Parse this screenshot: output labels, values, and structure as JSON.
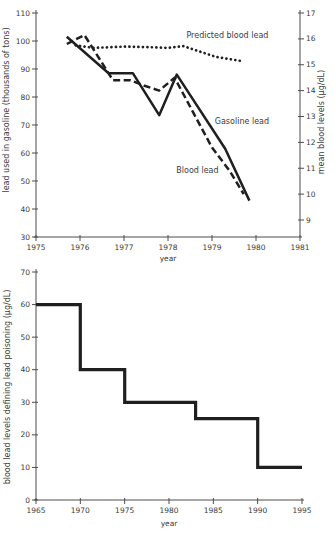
{
  "page": {
    "background": "#ffffff",
    "ink": "#1f1f1f",
    "axis_color": "#4d4d4d",
    "text_color": "#3b3b3b"
  },
  "chart_data": [
    {
      "id": "gasoline-blood-lead",
      "type": "line",
      "title": "",
      "xlabel": "year",
      "xlim": [
        1975,
        1981
      ],
      "xticks": [
        1975,
        1976,
        1977,
        1978,
        1979,
        1980,
        1981
      ],
      "left_axis": {
        "label": "lead used in gasoline (thousands of tons)",
        "lim": [
          30,
          110
        ],
        "ticks": [
          30,
          40,
          50,
          60,
          70,
          80,
          90,
          100,
          110
        ]
      },
      "right_axis": {
        "label": "mean blood levels (µg/dL)",
        "lim": [
          9,
          17
        ],
        "ticks": [
          9,
          10,
          11,
          12,
          13,
          14,
          15,
          16,
          17
        ]
      },
      "grid": false,
      "legend": "inline-annotations",
      "series": [
        {
          "name": "Gasoline lead",
          "axis": "left",
          "style": "solid",
          "points": [
            [
              1975.7,
              101.5
            ],
            [
              1976.65,
              88.5
            ],
            [
              1977.2,
              88.5
            ],
            [
              1977.8,
              73.5
            ],
            [
              1978.2,
              88
            ],
            [
              1979.3,
              61.5
            ],
            [
              1979.85,
              43
            ]
          ]
        },
        {
          "name": "Blood lead",
          "axis": "right",
          "style": "dashed",
          "points": [
            [
              1975.7,
              15.8
            ],
            [
              1976.1,
              16.15
            ],
            [
              1976.75,
              14.4
            ],
            [
              1977.15,
              14.4
            ],
            [
              1977.45,
              14.2
            ],
            [
              1977.8,
              14.0
            ],
            [
              1978.15,
              14.5
            ],
            [
              1979.0,
              11.8
            ],
            [
              1979.4,
              10.9
            ],
            [
              1979.72,
              10.0
            ]
          ]
        },
        {
          "name": "Predicted blood lead",
          "axis": "right",
          "style": "dotted",
          "points": [
            [
              1975.9,
              15.75
            ],
            [
              1976.3,
              15.65
            ],
            [
              1977.0,
              15.7
            ],
            [
              1977.6,
              15.68
            ],
            [
              1978.0,
              15.65
            ],
            [
              1978.35,
              15.72
            ],
            [
              1978.65,
              15.55
            ],
            [
              1979.1,
              15.3
            ],
            [
              1979.65,
              15.15
            ]
          ]
        }
      ],
      "annotations": [
        {
          "text": "Predicted blood lead",
          "x": 1979.35,
          "y": 16.05,
          "axis": "right"
        },
        {
          "text": "Gasoline lead",
          "x": 1979.68,
          "y": 70.5,
          "axis": "left"
        },
        {
          "text": "Blood lead",
          "x": 1978.67,
          "y": 53,
          "axis": "left"
        }
      ]
    },
    {
      "id": "lead-poisoning-definition",
      "type": "step",
      "title": "",
      "xlabel": "year",
      "xlim": [
        1965,
        1995
      ],
      "xticks": [
        1965,
        1970,
        1975,
        1980,
        1985,
        1990,
        1995
      ],
      "left_axis": {
        "label": "blood lead levels defining lead poisoning (µg/dL)",
        "lim": [
          0,
          70
        ],
        "ticks": [
          0,
          10,
          20,
          30,
          40,
          50,
          60,
          70
        ]
      },
      "grid": false,
      "series": [
        {
          "name": "blood lead level defining lead poisoning",
          "axis": "left",
          "style": "step-solid",
          "points": [
            [
              1965,
              60
            ],
            [
              1970,
              60
            ],
            [
              1970,
              40
            ],
            [
              1975,
              40
            ],
            [
              1975,
              30
            ],
            [
              1983,
              30
            ],
            [
              1983,
              25
            ],
            [
              1990,
              25
            ],
            [
              1990,
              10
            ],
            [
              1995,
              10
            ]
          ]
        }
      ],
      "annotations": []
    }
  ]
}
